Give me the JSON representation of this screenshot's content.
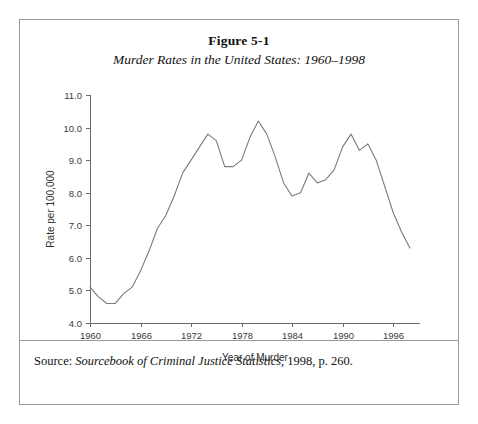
{
  "figure": {
    "title": "Figure 5-1",
    "subtitle": "Murder Rates in the United States: 1960–1998",
    "source": {
      "label": "Source:",
      "title": " Sourcebook of Criminal Justice Statistics",
      "tail": ", 1998, p. 260."
    },
    "border_color": "#9a9a9a",
    "line_color": "#7a7a7a"
  },
  "chart_data": {
    "type": "line",
    "title": "Murder Rates in the United States: 1960–1998",
    "xlabel": "Year of Murder",
    "ylabel": "Rate per 100,000",
    "xlim": [
      1960,
      1998
    ],
    "ylim": [
      4.0,
      11.0
    ],
    "grid": false,
    "legend": "none",
    "xticks": [
      1960,
      1966,
      1972,
      1978,
      1984,
      1990,
      1996
    ],
    "xtick_labels": [
      "1960",
      "1966",
      "1972",
      "1978",
      "1984",
      "1990",
      "1996"
    ],
    "yticks": [
      4.0,
      5.0,
      6.0,
      7.0,
      8.0,
      9.0,
      10.0,
      11.0
    ],
    "ytick_labels": [
      "4.0",
      "5.0",
      "6.0",
      "7.0",
      "8.0",
      "9.0",
      "10.0",
      "11.0"
    ],
    "series": [
      {
        "name": "Murder rate per 100,000",
        "x": [
          1960,
          1961,
          1962,
          1963,
          1964,
          1965,
          1966,
          1967,
          1968,
          1969,
          1970,
          1971,
          1972,
          1973,
          1974,
          1975,
          1976,
          1977,
          1978,
          1979,
          1980,
          1981,
          1982,
          1983,
          1984,
          1985,
          1986,
          1987,
          1988,
          1989,
          1990,
          1991,
          1992,
          1993,
          1994,
          1995,
          1996,
          1997,
          1998
        ],
        "values": [
          5.1,
          4.8,
          4.6,
          4.6,
          4.9,
          5.1,
          5.6,
          6.2,
          6.9,
          7.3,
          7.9,
          8.6,
          9.0,
          9.4,
          9.8,
          9.6,
          8.8,
          8.8,
          9.0,
          9.7,
          10.2,
          9.8,
          9.1,
          8.3,
          7.9,
          8.0,
          8.6,
          8.3,
          8.4,
          8.7,
          9.4,
          9.8,
          9.3,
          9.5,
          9.0,
          8.2,
          7.4,
          6.8,
          6.3
        ]
      }
    ]
  }
}
